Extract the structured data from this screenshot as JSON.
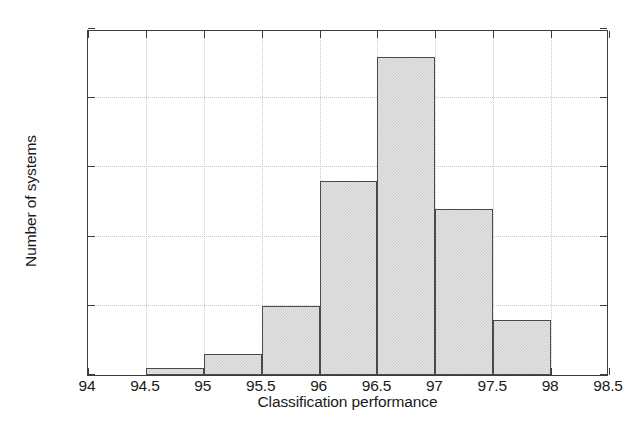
{
  "chart_data": {
    "type": "bar",
    "title": "",
    "subtitle": "",
    "xlabel": "Classification performance",
    "ylabel": "Number of systems",
    "xlim": [
      94,
      98.5
    ],
    "ylim": [
      0,
      50
    ],
    "grid": true,
    "legend": null,
    "bin_width": 0.5,
    "categories": [
      "94.5-95",
      "95-95.5",
      "95.5-96",
      "96-96.5",
      "96.5-97",
      "97-97.5",
      "97.5-98"
    ],
    "bin_edges": [
      94.5,
      95,
      95.5,
      96,
      96.5,
      97,
      97.5,
      98
    ],
    "values": [
      1,
      3,
      10,
      28,
      46,
      24,
      8
    ],
    "total": 120,
    "xticks": [
      "94",
      "94.5",
      "95",
      "95.5",
      "96",
      "96.5",
      "97",
      "97.5",
      "98",
      "98.5"
    ],
    "xtick_values": [
      94,
      94.5,
      95,
      95.5,
      96,
      96.5,
      97,
      97.5,
      98,
      98.5
    ],
    "yticks": [
      "0",
      "10",
      "20",
      "30",
      "40",
      "50"
    ],
    "ytick_values": [
      0,
      10,
      20,
      30,
      40,
      50
    ],
    "bar_fill_color": "#e3e3e3",
    "bar_edge_color": "#4a4a4a",
    "grid_color": "#c9c9c9",
    "axis_color": "#3c3c3c",
    "text_color": "#1a1a1a",
    "background_color": "#ffffff"
  }
}
